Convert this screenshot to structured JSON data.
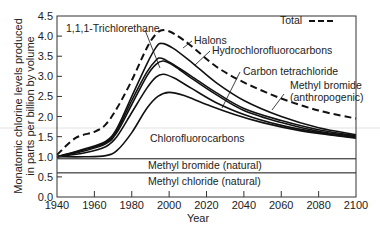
{
  "chart_data": {
    "type": "line",
    "title": "",
    "xlabel": "Year",
    "ylabel": "Monatomic chlorine levels produced in parts per billion by volume",
    "ylabel_lines": [
      "Monatomic chlorine levels produced",
      "in parts per billion by volume"
    ],
    "xlim": [
      1940,
      2100
    ],
    "ylim": [
      0.0,
      4.5
    ],
    "x_ticks": [
      1940,
      1960,
      1980,
      2000,
      2020,
      2040,
      2060,
      2080,
      2100
    ],
    "y_ticks": [
      "0.0",
      "0.5",
      "1.0",
      "1.5",
      "2.0",
      "2.5",
      "3.0",
      "3.5",
      "4.0",
      "4.5"
    ],
    "grid": false,
    "legend": {
      "position": "top-right",
      "entries": [
        {
          "label": "Total",
          "style": "dashed"
        }
      ]
    },
    "series": [
      {
        "name": "Total",
        "style": "dashed",
        "x": [
          1940,
          1950,
          1960,
          1966,
          1972,
          1980,
          1988,
          1993,
          1997,
          2003,
          2012,
          2025,
          2040,
          2060,
          2080,
          2100
        ],
        "values": [
          1.05,
          1.47,
          1.62,
          1.8,
          2.2,
          2.9,
          3.7,
          4.05,
          4.15,
          4.05,
          3.75,
          3.25,
          2.85,
          2.45,
          2.15,
          1.95
        ]
      },
      {
        "name": "Halons (cumulative band)",
        "style": "solid",
        "x": [
          1940,
          1955,
          1966,
          1972,
          1980,
          1988,
          1993,
          1996,
          2002,
          2012,
          2025,
          2040,
          2060,
          2080,
          2100
        ],
        "values": [
          1.0,
          1.2,
          1.38,
          1.7,
          2.5,
          3.3,
          3.72,
          3.82,
          3.7,
          3.35,
          2.85,
          2.4,
          2.0,
          1.72,
          1.55
        ]
      },
      {
        "name": "1,1,1-Trichlorethane (cumulative band)",
        "style": "solid",
        "x": [
          1940,
          1955,
          1966,
          1972,
          1980,
          1988,
          1993,
          1996,
          2002,
          2012,
          2025,
          2040,
          2060,
          2080,
          2100
        ],
        "values": [
          1.0,
          1.18,
          1.35,
          1.65,
          2.4,
          3.1,
          3.4,
          3.45,
          3.3,
          3.0,
          2.6,
          2.2,
          1.9,
          1.67,
          1.52
        ]
      },
      {
        "name": "Hydrochlorofluorocarbons (cumulative band)",
        "style": "solid",
        "x": [
          1940,
          1955,
          1966,
          1972,
          1980,
          1988,
          1993,
          1997,
          2003,
          2012,
          2025,
          2040,
          2060,
          2080,
          2100
        ],
        "values": [
          1.0,
          1.15,
          1.32,
          1.6,
          2.3,
          3.0,
          3.3,
          3.38,
          3.25,
          2.95,
          2.55,
          2.15,
          1.85,
          1.63,
          1.5
        ]
      },
      {
        "name": "Carbon tetrachloride (cumulative band)",
        "style": "solid",
        "x": [
          1940,
          1955,
          1966,
          1972,
          1980,
          1988,
          1993,
          1997,
          2003,
          2012,
          2025,
          2040,
          2060,
          2080,
          2100
        ],
        "values": [
          1.0,
          1.1,
          1.25,
          1.5,
          2.1,
          2.7,
          2.98,
          3.05,
          2.95,
          2.7,
          2.35,
          2.05,
          1.78,
          1.6,
          1.48
        ]
      },
      {
        "name": "Chlorofluorocarbons (cumulative band)",
        "style": "solid",
        "x": [
          1940,
          1955,
          1966,
          1972,
          1980,
          1988,
          1994,
          2000,
          2008,
          2020,
          2035,
          2050,
          2070,
          2085,
          2100
        ],
        "values": [
          1.0,
          1.0,
          1.03,
          1.15,
          1.6,
          2.2,
          2.5,
          2.6,
          2.52,
          2.3,
          2.05,
          1.85,
          1.65,
          1.55,
          1.46
        ]
      },
      {
        "name": "Methyl bromide (natural)",
        "style": "solid",
        "x": [
          1940,
          2100
        ],
        "values": [
          0.95,
          0.95
        ]
      },
      {
        "name": "Methyl chloride (natural)",
        "style": "solid",
        "x": [
          1940,
          2100
        ],
        "values": [
          0.6,
          0.6
        ]
      }
    ],
    "annotations": [
      {
        "text": "1,1,1-Trichlorethane",
        "target_series": "1,1,1-Trichlorethane (cumulative band)"
      },
      {
        "text": "Halons",
        "target_series": "Halons (cumulative band)"
      },
      {
        "text": "Hydrochlorofluorocarbons",
        "target_series": "Hydrochlorofluorocarbons (cumulative band)"
      },
      {
        "text": "Carbon tetrachloride",
        "target_series": "Carbon tetrachloride (cumulative band)"
      },
      {
        "text": "Methyl bromide",
        "text2": "(anthropogenic)",
        "target_series": "Total"
      },
      {
        "text": "Chlorofluorocarbons",
        "target_series": "Chlorofluorocarbons (cumulative band)"
      },
      {
        "text": "Methyl bromide (natural)",
        "target_series": "Methyl bromide (natural)"
      },
      {
        "text": "Methyl chloride (natural)",
        "target_series": "Methyl chloride (natural)"
      }
    ]
  },
  "labels": {
    "legend_total": "Total",
    "trichlorethane": "1,1,1-Trichlorethane",
    "halons": "Halons",
    "hcfc": "Hydrochlorofluorocarbons",
    "carbon_tet": "Carbon tetrachloride",
    "methyl_bromide_anthro_1": "Methyl bromide",
    "methyl_bromide_anthro_2": "(anthropogenic)",
    "cfc": "Chlorofluorocarbons",
    "methyl_bromide_nat": "Methyl bromide (natural)",
    "methyl_chloride_nat": "Methyl chloride (natural)",
    "xlabel": "Year",
    "ylabel_1": "Monatomic chlorine levels produced",
    "ylabel_2": "in parts per billion by volume"
  },
  "colors": {
    "line": "#111111",
    "axis": "#333333",
    "text": "#222222",
    "artifact": "#dcdcdc"
  }
}
